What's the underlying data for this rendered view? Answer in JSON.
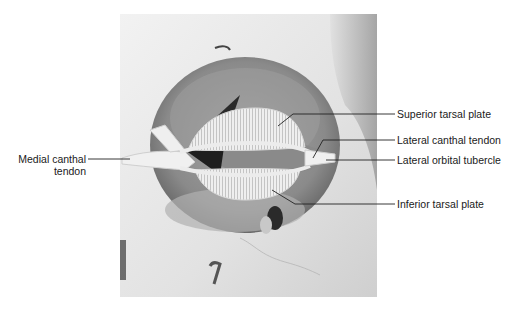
{
  "figure": {
    "labels": {
      "medial_canthal_tendon_line1": "Medial canthal",
      "medial_canthal_tendon_line2": "tendon",
      "superior_tarsal_plate": "Superior tarsal plate",
      "lateral_canthal_tendon": "Lateral canthal tendon",
      "lateral_orbital_tubercle": "Lateral orbital tubercle",
      "inferior_tarsal_plate": "Inferior tarsal plate"
    },
    "colors": {
      "background": "#ffffff",
      "bone_light": "#e6e6e6",
      "orbit_dark": "#7a7a7a",
      "leader_line": "#222222"
    }
  }
}
